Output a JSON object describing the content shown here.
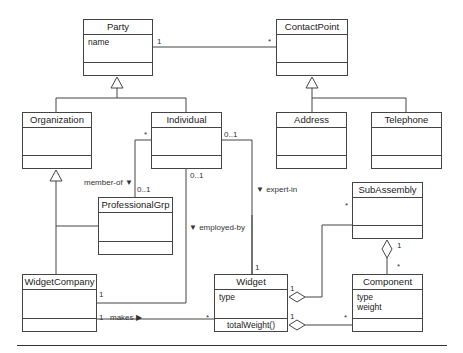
{
  "diagram": {
    "type": "UML class diagram",
    "classes": {
      "party": {
        "name": "Party",
        "attributes": [
          "name"
        ],
        "operations": []
      },
      "contact_point": {
        "name": "ContactPoint",
        "attributes": [],
        "operations": []
      },
      "organization": {
        "name": "Organization",
        "attributes": [],
        "operations": []
      },
      "individual": {
        "name": "Individual",
        "attributes": [],
        "operations": []
      },
      "address": {
        "name": "Address",
        "attributes": [],
        "operations": []
      },
      "telephone": {
        "name": "Telephone",
        "attributes": [],
        "operations": []
      },
      "professional_grp": {
        "name": "ProfessionalGrp",
        "attributes": [],
        "operations": []
      },
      "sub_assembly": {
        "name": "SubAssembly",
        "attributes": [],
        "operations": []
      },
      "widget_company": {
        "name": "WidgetCompany",
        "attributes": [],
        "operations": []
      },
      "widget": {
        "name": "Widget",
        "attributes": [
          "type"
        ],
        "operations": [
          "totalWeight()"
        ]
      },
      "component": {
        "name": "Component",
        "attributes": [
          "type",
          "weight"
        ],
        "operations": []
      }
    },
    "associations": {
      "party_contact": {
        "from": "Party",
        "to": "ContactPoint",
        "from_mult": "1",
        "to_mult": "*"
      },
      "member_of": {
        "label": "member-of ▼",
        "from": "Individual",
        "to": "ProfessionalGrp",
        "from_mult": "*",
        "to_mult": "0..1"
      },
      "employed_by": {
        "label": "▼ employed-by",
        "from": "Individual",
        "to": "WidgetCompany",
        "from_mult": "0..1",
        "to_mult": "1"
      },
      "expert_in": {
        "label": "▼ expert-in",
        "from": "Individual",
        "to": "Widget",
        "from_mult": "0..1",
        "to_mult": "1"
      },
      "makes": {
        "label": "makes ▶",
        "from": "WidgetCompany",
        "to": "Widget",
        "from_mult": "1",
        "to_mult": "*"
      },
      "widget_subassembly": {
        "kind": "aggregation",
        "whole": "Widget",
        "part": "SubAssembly",
        "whole_mult": "1",
        "part_mult": "*"
      },
      "widget_component": {
        "kind": "aggregation",
        "whole": "Widget",
        "part": "Component",
        "whole_mult": "1",
        "part_mult": "*"
      },
      "subassembly_component": {
        "kind": "aggregation",
        "whole": "SubAssembly",
        "part": "Component",
        "whole_mult": "1",
        "part_mult": "*"
      }
    },
    "generalizations": [
      {
        "parent": "Party",
        "children": [
          "Organization",
          "Individual"
        ]
      },
      {
        "parent": "ContactPoint",
        "children": [
          "Address",
          "Telephone"
        ]
      },
      {
        "parent": "Organization",
        "children": [
          "WidgetCompany",
          "ProfessionalGrp"
        ]
      }
    ]
  }
}
